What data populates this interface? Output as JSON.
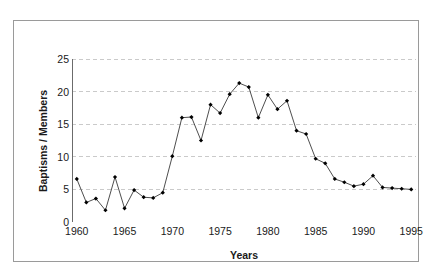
{
  "figure": {
    "top_partial_text": "",
    "frame_color": "#9a9a9a",
    "background": "#ffffff"
  },
  "chart_data": {
    "type": "line",
    "title": "",
    "subtitle": "",
    "xlabel": "Years",
    "ylabel": "Baptisms / Members",
    "xlim": [
      1959.5,
      1995.5
    ],
    "ylim": [
      0,
      25
    ],
    "ytick_values": [
      0,
      5,
      10,
      15,
      20,
      25
    ],
    "ytick_labels": [
      "0",
      "5",
      "10",
      "15",
      "20",
      "25"
    ],
    "xtick_values": [
      1960,
      1965,
      1970,
      1975,
      1980,
      1985,
      1990,
      1995
    ],
    "xtick_labels": [
      "1960",
      "1965",
      "1970",
      "1975",
      "1980",
      "1985",
      "1990",
      "1995"
    ],
    "grid": "horizontal-dashed",
    "grid_color": "#bdbdbd",
    "legend": "none",
    "line_color": "#3a3a3a",
    "marker": "filled-diamond",
    "marker_color": "#000000",
    "x": [
      1960,
      1961,
      1962,
      1963,
      1964,
      1965,
      1966,
      1967,
      1968,
      1969,
      1970,
      1971,
      1972,
      1973,
      1974,
      1975,
      1976,
      1977,
      1978,
      1979,
      1980,
      1981,
      1982,
      1983,
      1984,
      1985,
      1986,
      1987,
      1988,
      1989,
      1990,
      1991,
      1992,
      1993,
      1994,
      1995
    ],
    "values": [
      6.6,
      3.0,
      3.6,
      1.8,
      6.9,
      2.1,
      4.9,
      3.8,
      3.7,
      4.5,
      10.1,
      16.0,
      16.1,
      12.5,
      18.0,
      16.7,
      19.6,
      21.3,
      20.7,
      16.0,
      19.5,
      17.3,
      18.6,
      14.0,
      13.5,
      9.7,
      9.0,
      6.6,
      6.1,
      5.5,
      5.8,
      7.1,
      5.3,
      5.2,
      5.1,
      5.0
    ],
    "series": [
      {
        "name": "Baptisms / Members",
        "values": [
          6.6,
          3.0,
          3.6,
          1.8,
          6.9,
          2.1,
          4.9,
          3.8,
          3.7,
          4.5,
          10.1,
          16.0,
          16.1,
          12.5,
          18.0,
          16.7,
          19.6,
          21.3,
          20.7,
          16.0,
          19.5,
          17.3,
          18.6,
          14.0,
          13.5,
          9.7,
          9.0,
          6.6,
          6.1,
          5.5,
          5.8,
          7.1,
          5.3,
          5.2,
          5.1,
          5.0
        ]
      }
    ]
  }
}
